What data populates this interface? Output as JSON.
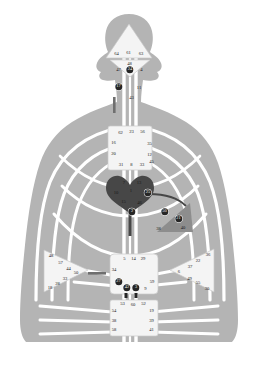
{
  "diagram": {
    "type": "human-design-bodygraph",
    "colors": {
      "background": "#ffffff",
      "body_silhouette": "#b4b4b4",
      "channel_line": "#ffffff",
      "center_undefined": "#f4f4f4",
      "center_defined_dark": "#474747",
      "center_defined_mid": "#8d8d8d",
      "activated_gate_fill": "#262626",
      "activated_gate_text": "#ffffff",
      "gate_text": "#1a1a1a",
      "outline": "#c9c9c9"
    },
    "centers": [
      {
        "name": "head",
        "shape": "triangle",
        "state": "undefined",
        "gates": [
          "64",
          "61",
          "63"
        ]
      },
      {
        "name": "ajna",
        "shape": "triangle",
        "state": "undefined",
        "gates": [
          "47",
          "24",
          "4",
          "48"
        ]
      },
      {
        "name": "throat",
        "shape": "square",
        "state": "undefined",
        "gates": [
          "62",
          "23",
          "56",
          "16",
          "35",
          "20",
          "12",
          "31",
          "8",
          "33",
          "45"
        ]
      },
      {
        "name": "heart-will",
        "shape": "heart",
        "state": "defined",
        "gates": [
          "21",
          "40",
          "26",
          "51"
        ]
      },
      {
        "name": "g-center",
        "shape": "diamond",
        "state": "defined",
        "gates": [
          "7",
          "1",
          "13",
          "10",
          "25",
          "15",
          "46",
          "2"
        ]
      },
      {
        "name": "spleen",
        "shape": "triangle",
        "state": "defined",
        "gates": [
          "48",
          "57",
          "44",
          "50",
          "32",
          "28",
          "18"
        ]
      },
      {
        "name": "solar-plexus",
        "shape": "triangle",
        "state": "undefined",
        "gates": [
          "36",
          "22",
          "37",
          "6",
          "49",
          "55",
          "30"
        ]
      },
      {
        "name": "sacral",
        "shape": "square",
        "state": "undefined",
        "gates": [
          "5",
          "14",
          "29",
          "34",
          "59",
          "27",
          "42",
          "3",
          "9"
        ]
      },
      {
        "name": "root",
        "shape": "square",
        "state": "undefined",
        "gates": [
          "53",
          "60",
          "52",
          "54",
          "19",
          "38",
          "39",
          "58",
          "41"
        ]
      }
    ],
    "gate_labels": [
      {
        "id": "g64",
        "label": "64",
        "x": 116.5,
        "y": 54.0,
        "activated": false,
        "center": "head"
      },
      {
        "id": "g61",
        "label": "61",
        "x": 128.5,
        "y": 53.2,
        "activated": false,
        "center": "head"
      },
      {
        "id": "g63",
        "label": "63",
        "x": 141.0,
        "y": 54.0,
        "activated": false,
        "center": "head"
      },
      {
        "id": "g48a",
        "label": "48",
        "x": 129.5,
        "y": 64.0,
        "activated": false,
        "center": "ajna"
      },
      {
        "id": "g47",
        "label": "47",
        "x": 118.5,
        "y": 70.0,
        "activated": false,
        "center": "ajna"
      },
      {
        "id": "g24",
        "label": "24",
        "x": 130.0,
        "y": 70.0,
        "activated": true,
        "center": "ajna"
      },
      {
        "id": "g4",
        "label": "4",
        "x": 141.5,
        "y": 70.0,
        "activated": false,
        "center": "ajna"
      },
      {
        "id": "g17",
        "label": "17",
        "x": 118.5,
        "y": 86.5,
        "activated": true,
        "center": "throat"
      },
      {
        "id": "g11",
        "label": "11",
        "x": 139.0,
        "y": 87.5,
        "activated": false,
        "center": "throat"
      },
      {
        "id": "g43",
        "label": "43",
        "x": 131.5,
        "y": 98.0,
        "activated": false,
        "center": "throat"
      },
      {
        "id": "g62",
        "label": "62",
        "x": 120.5,
        "y": 132.5,
        "activated": false,
        "center": "throat"
      },
      {
        "id": "g23",
        "label": "23",
        "x": 131.5,
        "y": 132.0,
        "activated": false,
        "center": "throat"
      },
      {
        "id": "g56",
        "label": "56",
        "x": 142.5,
        "y": 132.0,
        "activated": false,
        "center": "throat"
      },
      {
        "id": "g16",
        "label": "16",
        "x": 113.5,
        "y": 143.0,
        "activated": false,
        "center": "throat"
      },
      {
        "id": "g35",
        "label": "35",
        "x": 149.5,
        "y": 143.5,
        "activated": false,
        "center": "throat"
      },
      {
        "id": "g20",
        "label": "20",
        "x": 113.5,
        "y": 154.0,
        "activated": false,
        "center": "throat"
      },
      {
        "id": "g12",
        "label": "12",
        "x": 149.5,
        "y": 155.0,
        "activated": false,
        "center": "throat"
      },
      {
        "id": "g31",
        "label": "31",
        "x": 121.0,
        "y": 164.5,
        "activated": false,
        "center": "throat"
      },
      {
        "id": "g8",
        "label": "8",
        "x": 131.5,
        "y": 164.5,
        "activated": false,
        "center": "throat"
      },
      {
        "id": "g33",
        "label": "33",
        "x": 142.0,
        "y": 164.5,
        "activated": false,
        "center": "throat"
      },
      {
        "id": "g45",
        "label": "45",
        "x": 151.5,
        "y": 161.5,
        "activated": false,
        "center": "throat"
      },
      {
        "id": "g7",
        "label": "7",
        "x": 124.0,
        "y": 183.0,
        "activated": false,
        "center": "g-center"
      },
      {
        "id": "g13",
        "label": "13",
        "x": 139.0,
        "y": 182.5,
        "activated": false,
        "center": "g-center"
      },
      {
        "id": "g10",
        "label": "10",
        "x": 116.0,
        "y": 192.5,
        "activated": false,
        "center": "g-center"
      },
      {
        "id": "g1",
        "label": "1",
        "x": 131.0,
        "y": 190.5,
        "activated": false,
        "center": "g-center"
      },
      {
        "id": "g25",
        "label": "25",
        "x": 148.0,
        "y": 192.5,
        "activated": true,
        "center": "g-center"
      },
      {
        "id": "g15",
        "label": "15",
        "x": 123.5,
        "y": 202.0,
        "activated": false,
        "center": "g-center"
      },
      {
        "id": "g46",
        "label": "46",
        "x": 139.5,
        "y": 202.5,
        "activated": false,
        "center": "g-center"
      },
      {
        "id": "g2",
        "label": "2",
        "x": 132.0,
        "y": 211.5,
        "activated": true,
        "center": "g-center"
      },
      {
        "id": "g50",
        "label": "50",
        "x": 164.5,
        "y": 211.5,
        "activated": true,
        "center": "spleen"
      },
      {
        "id": "g21",
        "label": "21",
        "x": 178.5,
        "y": 218.5,
        "activated": true,
        "center": "heart-will"
      },
      {
        "id": "g38s",
        "label": "38",
        "x": 158.5,
        "y": 228.5,
        "activated": false,
        "center": "spleen"
      },
      {
        "id": "g40",
        "label": "40",
        "x": 183.0,
        "y": 228.0,
        "activated": false,
        "center": "heart-will"
      },
      {
        "id": "g48",
        "label": "48",
        "x": 51.0,
        "y": 256.0,
        "activated": false,
        "center": "spleen"
      },
      {
        "id": "g57",
        "label": "57",
        "x": 60.5,
        "y": 262.5,
        "activated": false,
        "center": "spleen"
      },
      {
        "id": "g44",
        "label": "44",
        "x": 68.5,
        "y": 268.5,
        "activated": false,
        "center": "spleen"
      },
      {
        "id": "g50b",
        "label": "50",
        "x": 76.0,
        "y": 272.5,
        "activated": false,
        "center": "spleen"
      },
      {
        "id": "g33b",
        "label": "33",
        "x": 65.0,
        "y": 279.0,
        "activated": false,
        "center": "spleen"
      },
      {
        "id": "g28",
        "label": "28",
        "x": 57.5,
        "y": 284.0,
        "activated": false,
        "center": "spleen"
      },
      {
        "id": "g18",
        "label": "18",
        "x": 50.0,
        "y": 288.0,
        "activated": false,
        "center": "spleen"
      },
      {
        "id": "g36",
        "label": "36",
        "x": 208.0,
        "y": 254.5,
        "activated": false,
        "center": "solar-plexus"
      },
      {
        "id": "g22",
        "label": "22",
        "x": 198.0,
        "y": 261.0,
        "activated": false,
        "center": "solar-plexus"
      },
      {
        "id": "g37",
        "label": "37",
        "x": 190.0,
        "y": 267.0,
        "activated": false,
        "center": "solar-plexus"
      },
      {
        "id": "g6",
        "label": "6",
        "x": 179.0,
        "y": 272.0,
        "activated": false,
        "center": "solar-plexus"
      },
      {
        "id": "g49",
        "label": "49",
        "x": 189.5,
        "y": 278.5,
        "activated": false,
        "center": "solar-plexus"
      },
      {
        "id": "g55",
        "label": "55",
        "x": 198.0,
        "y": 283.0,
        "activated": false,
        "center": "solar-plexus"
      },
      {
        "id": "g30",
        "label": "30",
        "x": 207.0,
        "y": 288.5,
        "activated": false,
        "center": "solar-plexus"
      },
      {
        "id": "g5",
        "label": "5",
        "x": 124.5,
        "y": 259.0,
        "activated": false,
        "center": "sacral"
      },
      {
        "id": "g14",
        "label": "14",
        "x": 133.5,
        "y": 259.0,
        "activated": false,
        "center": "sacral"
      },
      {
        "id": "g29",
        "label": "29",
        "x": 143.0,
        "y": 259.0,
        "activated": false,
        "center": "sacral"
      },
      {
        "id": "g34",
        "label": "34",
        "x": 114.0,
        "y": 270.0,
        "activated": false,
        "center": "sacral"
      },
      {
        "id": "g59",
        "label": "59",
        "x": 152.0,
        "y": 281.5,
        "activated": false,
        "center": "sacral"
      },
      {
        "id": "g27",
        "label": "27",
        "x": 118.5,
        "y": 281.5,
        "activated": true,
        "center": "sacral"
      },
      {
        "id": "g42",
        "label": "42",
        "x": 127.0,
        "y": 287.5,
        "activated": true,
        "center": "sacral"
      },
      {
        "id": "g3",
        "label": "3",
        "x": 136.0,
        "y": 287.5,
        "activated": true,
        "center": "sacral"
      },
      {
        "id": "g9",
        "label": "9",
        "x": 145.5,
        "y": 288.5,
        "activated": false,
        "center": "sacral"
      },
      {
        "id": "g53",
        "label": "53",
        "x": 122.5,
        "y": 304.0,
        "activated": false,
        "center": "root"
      },
      {
        "id": "g60",
        "label": "60",
        "x": 133.0,
        "y": 304.5,
        "activated": false,
        "center": "root"
      },
      {
        "id": "g52",
        "label": "52",
        "x": 143.5,
        "y": 304.0,
        "activated": false,
        "center": "root"
      },
      {
        "id": "g54",
        "label": "54",
        "x": 114.0,
        "y": 310.5,
        "activated": false,
        "center": "root"
      },
      {
        "id": "g19",
        "label": "19",
        "x": 151.5,
        "y": 310.5,
        "activated": false,
        "center": "root"
      },
      {
        "id": "g38r",
        "label": "38",
        "x": 114.0,
        "y": 320.5,
        "activated": false,
        "center": "root"
      },
      {
        "id": "g39",
        "label": "39",
        "x": 151.5,
        "y": 320.5,
        "activated": false,
        "center": "root"
      },
      {
        "id": "g58",
        "label": "58",
        "x": 114.0,
        "y": 330.0,
        "activated": false,
        "center": "root"
      },
      {
        "id": "g41",
        "label": "41",
        "x": 151.5,
        "y": 330.0,
        "activated": false,
        "center": "root"
      }
    ]
  }
}
